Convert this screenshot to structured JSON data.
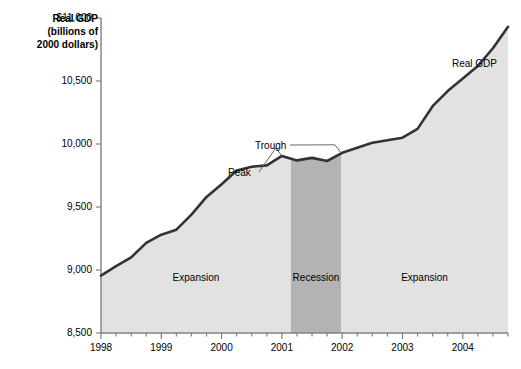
{
  "chart_data": {
    "type": "area",
    "title": "",
    "ylabel_line1": "Real GDP",
    "ylabel_line2": "(billions of",
    "ylabel_line3": "2000 dollars)",
    "xlabel": "",
    "grid": false,
    "legend_position": "inline-right",
    "xlim": [
      1998,
      2004.75
    ],
    "ylim": [
      8500,
      11000
    ],
    "yticks": [
      8500,
      9000,
      9500,
      10000,
      10500,
      11000
    ],
    "ytick_labels": [
      "8,500",
      "9,000",
      "9,500",
      "10,000",
      "10,500",
      "$11,000"
    ],
    "xticks": [
      1998,
      1999,
      2000,
      2001,
      2002,
      2003,
      2004
    ],
    "xtick_labels": [
      "1998",
      "1999",
      "2000",
      "2001",
      "2002",
      "2003",
      "2004"
    ],
    "x_minor_tick_step": 0.25,
    "series": [
      {
        "name": "Real GDP",
        "x": [
          1998.0,
          1998.25,
          1998.5,
          1998.75,
          1999.0,
          1999.25,
          1999.5,
          1999.75,
          2000.0,
          2000.25,
          2000.5,
          2000.75,
          2001.0,
          2001.25,
          2001.5,
          2001.75,
          2002.0,
          2002.25,
          2002.5,
          2002.75,
          2003.0,
          2003.25,
          2003.5,
          2003.75,
          2004.0,
          2004.25,
          2004.5,
          2004.75
        ],
        "values": [
          8955,
          9030,
          9100,
          9215,
          9280,
          9320,
          9440,
          9580,
          9680,
          9790,
          9820,
          9830,
          9905,
          9870,
          9890,
          9865,
          9930,
          9970,
          10010,
          10030,
          10050,
          10120,
          10300,
          10420,
          10520,
          10620,
          10760,
          10930
        ]
      }
    ],
    "shaded_regions": [
      {
        "label": "Expansion",
        "x_start": 1998.0,
        "x_end": 2001.15,
        "shade": "light"
      },
      {
        "label": "Recession",
        "x_start": 2001.15,
        "x_end": 2001.98,
        "shade": "dark"
      },
      {
        "label": "Expansion",
        "x_start": 2001.98,
        "x_end": 2004.75,
        "shade": "light"
      }
    ],
    "annotations": [
      {
        "label": "Peak",
        "x": 2001.0,
        "y": 9905
      },
      {
        "label": "Trough",
        "x": 2001.98,
        "y": 9930
      },
      {
        "label": "Real GDP",
        "x": 2004.6,
        "y": 10930
      }
    ],
    "colors": {
      "line": "#333333",
      "area_light": "#e2e2e2",
      "area_dark": "#b3b3b3",
      "axis": "#808080",
      "text": "#000000"
    }
  }
}
